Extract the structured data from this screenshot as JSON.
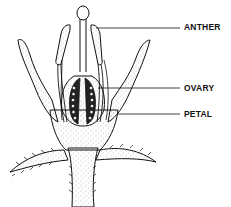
{
  "diagram": {
    "labels": [
      {
        "id": "anther",
        "text": "ANTHER",
        "x": 184,
        "y": 23
      },
      {
        "id": "ovary",
        "text": "OVARY",
        "x": 184,
        "y": 84
      },
      {
        "id": "petal",
        "text": "PETAL",
        "x": 184,
        "y": 110
      }
    ],
    "colors": {
      "ink": "#111111",
      "stipple": "#777777",
      "background": "#ffffff"
    }
  }
}
